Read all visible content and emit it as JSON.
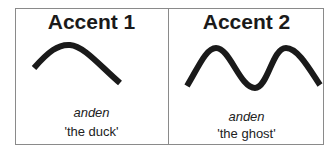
{
  "panels": [
    {
      "title": "Accent 1",
      "word": "anden",
      "gloss": "'the duck'",
      "contour": "single-peak"
    },
    {
      "title": "Accent 2",
      "word": "anden",
      "gloss": "'the ghost'",
      "contour": "double-peak"
    }
  ],
  "colors": {
    "stroke": "#1a1a1a",
    "border": "#8a8a8a"
  }
}
